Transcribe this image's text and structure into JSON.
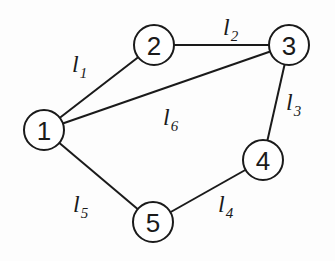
{
  "diagram": {
    "type": "graph",
    "nodes": [
      {
        "id": "1",
        "label": "1",
        "x": 44,
        "y": 130
      },
      {
        "id": "2",
        "label": "2",
        "x": 154,
        "y": 45
      },
      {
        "id": "3",
        "label": "3",
        "x": 289,
        "y": 45
      },
      {
        "id": "4",
        "label": "4",
        "x": 263,
        "y": 160
      },
      {
        "id": "5",
        "label": "5",
        "x": 153,
        "y": 222
      }
    ],
    "edges": [
      {
        "id": "l1",
        "from": "1",
        "to": "2",
        "label": "l",
        "sub": "1",
        "lx": 72,
        "ly": 72
      },
      {
        "id": "l2",
        "from": "2",
        "to": "3",
        "label": "l",
        "sub": "2",
        "lx": 223,
        "ly": 35
      },
      {
        "id": "l3",
        "from": "3",
        "to": "4",
        "label": "l",
        "sub": "3",
        "lx": 286,
        "ly": 110
      },
      {
        "id": "l4",
        "from": "4",
        "to": "5",
        "label": "l",
        "sub": "4",
        "lx": 218,
        "ly": 212
      },
      {
        "id": "l5",
        "from": "1",
        "to": "5",
        "label": "l",
        "sub": "5",
        "lx": 73,
        "ly": 212
      },
      {
        "id": "l6",
        "from": "1",
        "to": "3",
        "label": "l",
        "sub": "6",
        "lx": 163,
        "ly": 125
      }
    ]
  }
}
